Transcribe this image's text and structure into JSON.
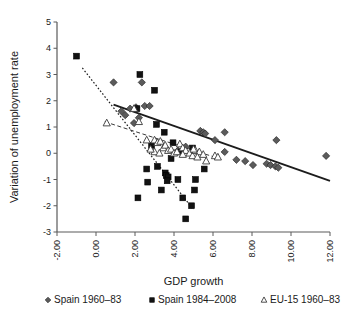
{
  "chart_data": {
    "type": "scatter",
    "title": "",
    "xlabel": "GDP growth",
    "ylabel": "Variation of unemployment rate",
    "xlim": [
      -2.0,
      12.0
    ],
    "ylim": [
      -3,
      5
    ],
    "xticks": [
      "-2.00",
      "0.00",
      "2.00",
      "4.00",
      "6.00",
      "8.00",
      "10.00",
      "12.00"
    ],
    "xtick_values": [
      -2,
      0,
      2,
      4,
      6,
      8,
      10,
      12
    ],
    "yticks": [
      "5",
      "4",
      "3",
      "2",
      "1",
      "0",
      "-1",
      "-2",
      "-3"
    ],
    "ytick_values": [
      5,
      4,
      3,
      2,
      1,
      0,
      -1,
      -2,
      -3
    ],
    "grid": false,
    "legend_position": "bottom",
    "series": [
      {
        "name": "Spain 1960–83",
        "marker": "diamond",
        "color": "#5b5b5b",
        "points": [
          [
            0.9,
            2.7
          ],
          [
            1.3,
            1.6
          ],
          [
            1.5,
            1.45
          ],
          [
            2.35,
            2.7
          ],
          [
            2.05,
            1.75
          ],
          [
            1.75,
            1.7
          ],
          [
            2.5,
            1.8
          ],
          [
            2.75,
            1.8
          ],
          [
            2.2,
            1.35
          ],
          [
            1.95,
            1.15
          ],
          [
            5.35,
            0.85
          ],
          [
            5.5,
            0.8
          ],
          [
            5.6,
            0.75
          ],
          [
            6.6,
            0.8
          ],
          [
            6.1,
            0.5
          ],
          [
            6.6,
            0.05
          ],
          [
            7.2,
            -0.25
          ],
          [
            7.65,
            -0.3
          ],
          [
            8.05,
            -0.45
          ],
          [
            8.75,
            -0.4
          ],
          [
            8.95,
            -0.45
          ],
          [
            9.2,
            -0.5
          ],
          [
            9.35,
            -0.55
          ],
          [
            9.25,
            0.5
          ],
          [
            11.8,
            -0.1
          ],
          [
            4.6,
            0.25
          ],
          [
            4.2,
            0.1
          ]
        ]
      },
      {
        "name": "Spain 1984–2008",
        "marker": "square",
        "color": "#121212",
        "points": [
          [
            -1.0,
            3.7
          ],
          [
            2.25,
            3.0
          ],
          [
            3.0,
            2.4
          ],
          [
            2.1,
            1.7
          ],
          [
            3.1,
            1.1
          ],
          [
            3.5,
            0.8
          ],
          [
            2.15,
            -1.7
          ],
          [
            2.6,
            -0.6
          ],
          [
            2.65,
            -1.1
          ],
          [
            3.15,
            -0.5
          ],
          [
            3.35,
            -1.4
          ],
          [
            3.55,
            -0.75
          ],
          [
            3.6,
            -0.85
          ],
          [
            3.7,
            -0.9
          ],
          [
            3.65,
            -1.05
          ],
          [
            3.85,
            -0.2
          ],
          [
            4.2,
            -1.0
          ],
          [
            4.45,
            -1.7
          ],
          [
            4.6,
            -2.5
          ],
          [
            4.9,
            -2.0
          ],
          [
            5.05,
            -1.4
          ],
          [
            5.1,
            -1.0
          ],
          [
            5.55,
            -0.6
          ],
          [
            2.85,
            0.3
          ],
          [
            3.95,
            0.4
          ],
          [
            4.95,
            0.2
          ],
          [
            4.35,
            0.05
          ]
        ]
      },
      {
        "name": "EU-15 1960–83",
        "marker": "triangle",
        "color": "#ffffff",
        "points": [
          [
            0.55,
            1.15
          ],
          [
            2.2,
            1.2
          ],
          [
            1.95,
            1.7
          ],
          [
            2.6,
            0.5
          ],
          [
            3.0,
            0.5
          ],
          [
            3.15,
            0.4
          ],
          [
            3.3,
            0.45
          ],
          [
            3.45,
            0.2
          ],
          [
            3.55,
            0.3
          ],
          [
            3.7,
            0.1
          ],
          [
            3.85,
            0.15
          ],
          [
            4.0,
            0.0
          ],
          [
            4.15,
            0.05
          ],
          [
            4.3,
            0.35
          ],
          [
            4.45,
            0.2
          ],
          [
            4.6,
            0.1
          ],
          [
            4.8,
            0.0
          ],
          [
            4.95,
            -0.1
          ],
          [
            5.1,
            0.1
          ],
          [
            5.3,
            0.05
          ],
          [
            5.5,
            -0.05
          ],
          [
            5.65,
            -0.3
          ],
          [
            6.1,
            -0.1
          ],
          [
            6.25,
            -0.15
          ],
          [
            3.0,
            0.05
          ],
          [
            3.25,
            0.0
          ],
          [
            2.8,
            0.15
          ],
          [
            4.45,
            -0.05
          ],
          [
            5.0,
            0.15
          ],
          [
            5.2,
            -0.15
          ]
        ]
      }
    ],
    "trendlines": [
      {
        "name": "Spain 1960–83 trend",
        "style": "solid",
        "from": [
          0.9,
          1.85
        ],
        "to": [
          12.0,
          -1.05
        ]
      },
      {
        "name": "Spain 1984–2008 trend",
        "style": "dotted",
        "from": [
          -0.7,
          3.25
        ],
        "to": [
          5.0,
          -2.15
        ]
      },
      {
        "name": "EU-15 1960–83 trend",
        "style": "dashed",
        "from": [
          0.45,
          1.2
        ],
        "to": [
          6.3,
          -0.2
        ]
      }
    ]
  },
  "legend": {
    "items": [
      {
        "label": "Spain 1960–83",
        "marker": "diamond"
      },
      {
        "label": "Spain 1984–2008",
        "marker": "square"
      },
      {
        "label": "EU-15 1960–83",
        "marker": "triangle"
      }
    ]
  }
}
